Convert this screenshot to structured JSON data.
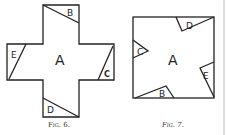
{
  "figures": [
    {
      "id": "fig6",
      "caption": "Fig. 6.",
      "shape": "cross",
      "center_label": "A",
      "corner_pieces": [
        {
          "label": "B",
          "position": "top arm"
        },
        {
          "label": "E",
          "position": "left arm"
        },
        {
          "label": "C",
          "position": "right arm"
        },
        {
          "label": "D",
          "position": "bottom arm"
        }
      ]
    },
    {
      "id": "fig7",
      "caption": "Fig. 7.",
      "shape": "square",
      "center_label": "A",
      "corner_pieces": [
        {
          "label": "D",
          "position": "top"
        },
        {
          "label": "C",
          "position": "left"
        },
        {
          "label": "E",
          "position": "right"
        },
        {
          "label": "B",
          "position": "bottom"
        }
      ]
    }
  ],
  "colors": {
    "ink": "#222222",
    "paper": "#ffffff",
    "page_edge": "#bbbbbb"
  }
}
